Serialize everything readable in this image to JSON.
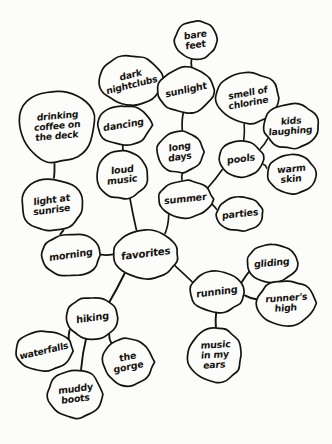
{
  "diagram": {
    "type": "hand-drawn-mind-map",
    "medium": "ink on paper",
    "ink_color": "#15130f",
    "paper_color": "#fcfcfb",
    "center_node": "favorites",
    "nodes": [
      {
        "id": "drinking-coffee",
        "label": "drinking\ncoffee on\nthe deck",
        "cx": 57,
        "cy": 126,
        "rx": 41,
        "ry": 39,
        "rot": -5,
        "fs": 9.2,
        "seed": 1
      },
      {
        "id": "light-at-sunrise",
        "label": "light at\nsunrise",
        "cx": 52,
        "cy": 205,
        "rx": 33,
        "ry": 28,
        "rot": -7,
        "fs": 9.4,
        "seed": 2
      },
      {
        "id": "morning",
        "label": "morning",
        "cx": 71,
        "cy": 255,
        "rx": 31,
        "ry": 23,
        "rot": -8,
        "fs": 9.6,
        "seed": 3
      },
      {
        "id": "dark-nightclubs",
        "label": "dark\nnightclubs",
        "cx": 131,
        "cy": 80,
        "rx": 34,
        "ry": 26,
        "rot": -14,
        "fs": 9.2,
        "seed": 4
      },
      {
        "id": "dancing",
        "label": "dancing",
        "cx": 124,
        "cy": 125,
        "rx": 29,
        "ry": 21,
        "rot": -9,
        "fs": 9.5,
        "seed": 5
      },
      {
        "id": "loud-music",
        "label": "loud\nmusic",
        "cx": 122,
        "cy": 175,
        "rx": 28,
        "ry": 25,
        "rot": -6,
        "fs": 9.6,
        "seed": 6
      },
      {
        "id": "bare-feet",
        "label": "bare\nfeet",
        "cx": 196,
        "cy": 40,
        "rx": 23,
        "ry": 20,
        "rot": -8,
        "fs": 9.3,
        "seed": 7
      },
      {
        "id": "sunlight",
        "label": "sunlight",
        "cx": 186,
        "cy": 90,
        "rx": 30,
        "ry": 24,
        "rot": -12,
        "fs": 9.5,
        "seed": 8
      },
      {
        "id": "long-days",
        "label": "long\ndays",
        "cx": 180,
        "cy": 152,
        "rx": 25,
        "ry": 22,
        "rot": -8,
        "fs": 9.4,
        "seed": 9
      },
      {
        "id": "summer",
        "label": "summer",
        "cx": 185,
        "cy": 199,
        "rx": 29,
        "ry": 20,
        "rot": -6,
        "fs": 9.6,
        "seed": 10
      },
      {
        "id": "smell-of-chlorine",
        "label": "smell of\nchlorine",
        "cx": 248,
        "cy": 98,
        "rx": 34,
        "ry": 27,
        "rot": -10,
        "fs": 9.2,
        "seed": 11
      },
      {
        "id": "kids-laughing",
        "label": "kids\nlaughing",
        "cx": 291,
        "cy": 126,
        "rx": 29,
        "ry": 24,
        "rot": -4,
        "fs": 9.2,
        "seed": 12
      },
      {
        "id": "pools",
        "label": "pools",
        "cx": 241,
        "cy": 159,
        "rx": 24,
        "ry": 19,
        "rot": -7,
        "fs": 9.6,
        "seed": 13
      },
      {
        "id": "warm-skin",
        "label": "warm\nskin",
        "cx": 291,
        "cy": 174,
        "rx": 26,
        "ry": 21,
        "rot": -5,
        "fs": 9.4,
        "seed": 14
      },
      {
        "id": "parties",
        "label": "parties",
        "cx": 240,
        "cy": 214,
        "rx": 25,
        "ry": 18,
        "rot": -6,
        "fs": 9.5,
        "seed": 15
      },
      {
        "id": "favorites",
        "label": "favorites",
        "cx": 146,
        "cy": 254,
        "rx": 34,
        "ry": 26,
        "rot": -7,
        "fs": 10.2,
        "seed": 16
      },
      {
        "id": "running",
        "label": "running",
        "cx": 217,
        "cy": 292,
        "rx": 29,
        "ry": 22,
        "rot": -7,
        "fs": 9.8,
        "seed": 17
      },
      {
        "id": "gliding",
        "label": "gliding",
        "cx": 272,
        "cy": 263,
        "rx": 27,
        "ry": 20,
        "rot": -5,
        "fs": 9.5,
        "seed": 18
      },
      {
        "id": "runners-high",
        "label": "runner's\nhigh",
        "cx": 286,
        "cy": 303,
        "rx": 31,
        "ry": 24,
        "rot": -4,
        "fs": 9.3,
        "seed": 19
      },
      {
        "id": "music-in-my-ears",
        "label": "music\nin my\nears",
        "cx": 215,
        "cy": 355,
        "rx": 29,
        "ry": 29,
        "rot": -3,
        "fs": 9.4,
        "seed": 20
      },
      {
        "id": "hiking",
        "label": "hiking",
        "cx": 92,
        "cy": 318,
        "rx": 28,
        "ry": 22,
        "rot": -8,
        "fs": 9.8,
        "seed": 21
      },
      {
        "id": "waterfalls",
        "label": "waterfalls",
        "cx": 44,
        "cy": 351,
        "rx": 31,
        "ry": 21,
        "rot": -13,
        "fs": 9.2,
        "seed": 22
      },
      {
        "id": "muddy-boots",
        "label": "muddy\nboots",
        "cx": 75,
        "cy": 394,
        "rx": 29,
        "ry": 26,
        "rot": -7,
        "fs": 9.4,
        "seed": 23
      },
      {
        "id": "the-gorge",
        "label": "the\ngorge",
        "cx": 128,
        "cy": 362,
        "rx": 27,
        "ry": 25,
        "rot": -11,
        "fs": 9.5,
        "seed": 24
      }
    ],
    "edges": [
      {
        "from": "drinking-coffee",
        "to": "light-at-sunrise"
      },
      {
        "from": "light-at-sunrise",
        "to": "morning"
      },
      {
        "from": "morning",
        "to": "favorites"
      },
      {
        "from": "dark-nightclubs",
        "to": "dancing"
      },
      {
        "from": "dancing",
        "to": "loud-music"
      },
      {
        "from": "loud-music",
        "to": "favorites"
      },
      {
        "from": "bare-feet",
        "to": "sunlight"
      },
      {
        "from": "sunlight",
        "to": "long-days"
      },
      {
        "from": "long-days",
        "to": "summer"
      },
      {
        "from": "summer",
        "to": "favorites"
      },
      {
        "from": "summer",
        "to": "pools"
      },
      {
        "from": "summer",
        "to": "parties"
      },
      {
        "from": "smell-of-chlorine",
        "to": "pools"
      },
      {
        "from": "kids-laughing",
        "to": "pools"
      },
      {
        "from": "warm-skin",
        "to": "pools"
      },
      {
        "from": "favorites",
        "to": "running"
      },
      {
        "from": "favorites",
        "to": "hiking"
      },
      {
        "from": "running",
        "to": "gliding"
      },
      {
        "from": "running",
        "to": "runners-high"
      },
      {
        "from": "running",
        "to": "music-in-my-ears"
      },
      {
        "from": "hiking",
        "to": "waterfalls"
      },
      {
        "from": "hiking",
        "to": "muddy-boots"
      },
      {
        "from": "hiking",
        "to": "the-gorge"
      }
    ]
  }
}
